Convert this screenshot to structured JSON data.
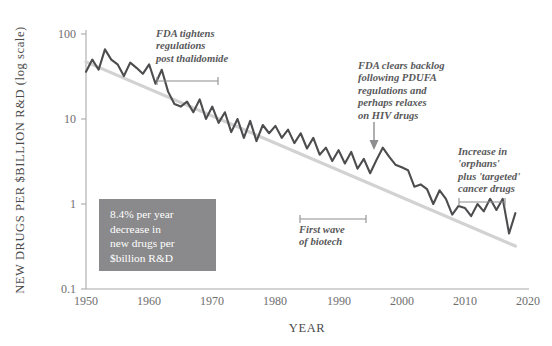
{
  "chart_data": {
    "type": "line",
    "title": "",
    "xlabel": "YEAR",
    "ylabel": "NEW DRUGS PER $BILLION R&D (log scale)",
    "yscale": "log",
    "ylim": [
      0.1,
      100
    ],
    "xlim": [
      1950,
      2020
    ],
    "ytick_labels": [
      "100",
      "10",
      "1",
      "0.1"
    ],
    "ytick_values": [
      100,
      10,
      1,
      0.1
    ],
    "xtick_labels": [
      "1950",
      "1960",
      "1970",
      "1980",
      "1990",
      "2000",
      "2010",
      "2020"
    ],
    "xtick_values": [
      1950,
      1960,
      1970,
      1980,
      1990,
      2000,
      2010,
      2020
    ],
    "grid": false,
    "legend": "none",
    "series": [
      {
        "name": "New drugs per $billion R&D",
        "color": "#4d4d4f",
        "x": [
          1950,
          1951,
          1952,
          1953,
          1954,
          1955,
          1956,
          1957,
          1958,
          1959,
          1960,
          1961,
          1962,
          1963,
          1964,
          1965,
          1966,
          1967,
          1968,
          1969,
          1970,
          1971,
          1972,
          1973,
          1974,
          1975,
          1976,
          1977,
          1978,
          1979,
          1980,
          1981,
          1982,
          1983,
          1984,
          1985,
          1986,
          1987,
          1988,
          1989,
          1990,
          1991,
          1992,
          1993,
          1994,
          1995,
          1996,
          1997,
          1998,
          1999,
          2000,
          2001,
          2002,
          2003,
          2004,
          2005,
          2006,
          2007,
          2008,
          2009,
          2010,
          2011,
          2012,
          2013,
          2014,
          2015,
          2016,
          2017,
          2018
        ],
        "y": [
          36,
          50,
          38,
          66,
          50,
          44,
          32,
          46,
          40,
          34,
          44,
          26,
          38,
          21,
          15,
          14,
          16,
          12,
          17,
          10,
          14,
          9.0,
          12,
          7.0,
          10,
          6.0,
          9.5,
          5.5,
          8.5,
          6.8,
          8.3,
          6.0,
          7.5,
          5.2,
          6.8,
          4.5,
          6.0,
          3.8,
          4.6,
          3.2,
          4.3,
          3.0,
          4.1,
          2.6,
          3.4,
          2.3,
          3.3,
          4.6,
          3.6,
          2.9,
          2.7,
          2.5,
          1.6,
          1.7,
          1.5,
          1.0,
          1.45,
          1.15,
          0.75,
          0.95,
          0.9,
          0.72,
          1.0,
          0.82,
          1.15,
          0.85,
          1.15,
          0.45,
          0.78
        ]
      },
      {
        "name": "Trend line (8.4% per year decrease)",
        "color": "#d2d2d2",
        "x": [
          1950,
          2018
        ],
        "y": [
          47,
          0.32
        ]
      }
    ],
    "annotations": [
      {
        "id": "fda-tightens",
        "text": "FDA tightens\nregulations\npost thalidomide",
        "bracket": {
          "x_start": 1962,
          "x_end": 1972
        }
      },
      {
        "id": "first-wave-biotech",
        "text": "First wave\nof biotech",
        "bracket": {
          "x_start": 1986,
          "x_end": 1997
        }
      },
      {
        "id": "fda-clears-backlog",
        "text": "FDA clears backlog\nfollowing PDUFA\nregulations and\nperhaps relaxes\non HIV drugs",
        "arrow": {
          "x": 1997,
          "points": "down"
        }
      },
      {
        "id": "orphans-targeted",
        "text": "Increase in\n'orphans'\nplus 'targeted'\ncancer drugs",
        "bracket": {
          "x_start": 2011,
          "x_end": 2018
        }
      }
    ],
    "callout": {
      "id": "rate-callout",
      "text": "8.4% per year\ndecrease in\nnew drugs per\n$billion R&D",
      "background": "#8a8a8c",
      "text_color": "#ffffff"
    }
  },
  "colors": {
    "data_line": "#4d4d4f",
    "trend_line": "#d2d2d2",
    "axis": "#aaaaaa",
    "tick_text": "#6e6e6e",
    "annotation_text": "#58585a",
    "callout_bg": "#8a8a8c",
    "background": "#ffffff"
  }
}
